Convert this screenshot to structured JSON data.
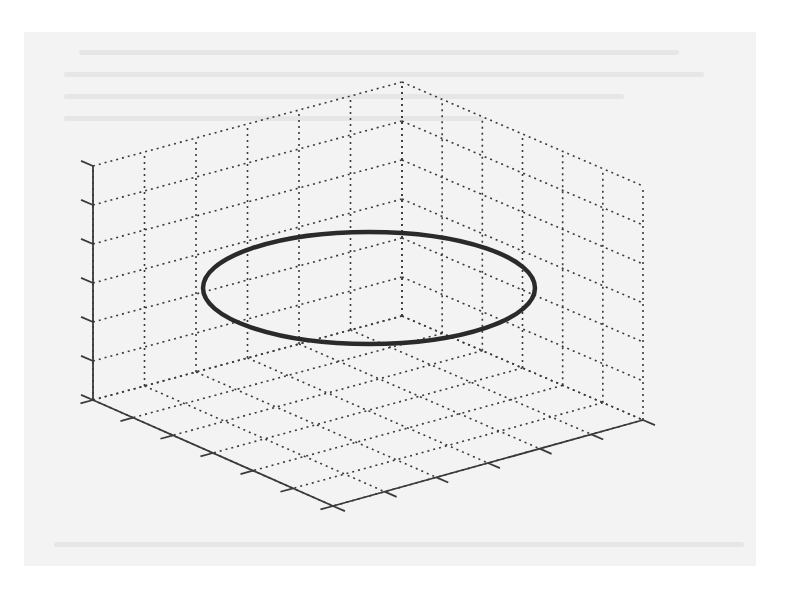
{
  "chart_data": {
    "type": "line",
    "projection": "3d",
    "title": "",
    "xlabel": "",
    "ylabel": "",
    "zlabel": "",
    "tick_labels_visible": false,
    "x_ticks": 7,
    "y_ticks": 7,
    "z_ticks": 7,
    "grid": true,
    "grid_style": "dotted",
    "series": [
      {
        "name": "circle",
        "description": "horizontal circle drawn at constant height, appearing as an ellipse in 3D perspective",
        "shape": "circle",
        "center_normalized": [
          0.5,
          0.5,
          0.5
        ],
        "radius_normalized": 0.5,
        "line_color": "#2a2a2a",
        "line_width": "thick"
      }
    ],
    "colors": {
      "line": "#2a2a2a",
      "grid": "#3a3a3a",
      "axes": "#3a3a3a",
      "paper": "#f3f3f3"
    }
  },
  "geometry": {
    "back_bottom": [
      402,
      316
    ],
    "left_bottom": [
      93,
      400
    ],
    "front_bottom": [
      333,
      506
    ],
    "right_bottom": [
      643,
      420
    ],
    "height": 234,
    "divisions": 6,
    "ellipse": {
      "cx": 369,
      "cy": 288,
      "rx": 166,
      "ry": 56
    }
  }
}
